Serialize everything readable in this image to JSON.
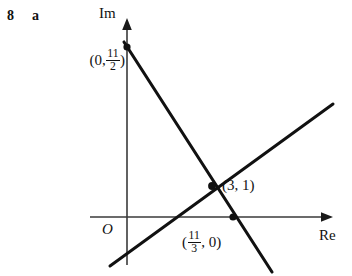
{
  "figure": {
    "exercise_number": "8",
    "exercise_part": "a",
    "axes": {
      "imaginary_label": "Im",
      "real_label": "Re",
      "origin_label": "O"
    },
    "labels": {
      "imaginary_intercept": {
        "open": "(0,",
        "numerator": "11",
        "denominator": "2",
        "close": ")"
      },
      "intersection": "(3, 1)",
      "real_intercept": {
        "open": "(",
        "numerator": "11",
        "denominator": "3",
        "close": ", 0)"
      }
    },
    "colors": {
      "ink": "#111111",
      "axis": "#3a3a3a",
      "background": "#ffffff"
    },
    "geometry": {
      "axis_x_y": 217,
      "axis_y_x": 127,
      "points": [
        {
          "name": "imaginary-intercept-point",
          "x": 127,
          "y": 47
        },
        {
          "name": "intersection-point",
          "x": 212,
          "y": 186
        },
        {
          "name": "real-intercept-point",
          "x": 233,
          "y": 217
        }
      ],
      "descending_line": {
        "x1": 124,
        "y1": 42,
        "x2": 272,
        "y2": 272
      },
      "ascending_line": {
        "x1": 110,
        "y1": 266,
        "x2": 333,
        "y2": 104
      }
    }
  }
}
